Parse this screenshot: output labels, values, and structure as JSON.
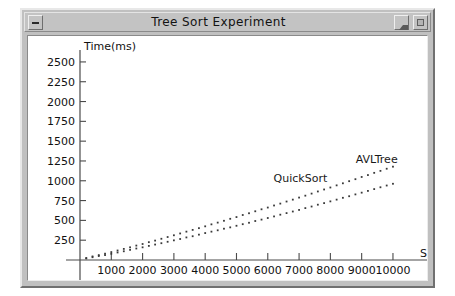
{
  "window": {
    "title": "Tree Sort Experiment",
    "buttons": {
      "menu": "window-menu",
      "minimize": "minimize",
      "maximize": "maximize"
    }
  },
  "chart_data": {
    "type": "scatter",
    "title": "Tree Sort Experiment",
    "xlabel": "Size",
    "ylabel": "Time(ms)",
    "xlim": [
      0,
      10800
    ],
    "ylim": [
      0,
      2600
    ],
    "xticks": [
      1000,
      2000,
      3000,
      4000,
      5000,
      6000,
      7000,
      8000,
      9000,
      10000
    ],
    "yticks": [
      250,
      500,
      750,
      1000,
      1250,
      1500,
      1750,
      2000,
      2250,
      2500
    ],
    "grid": false,
    "legend_position": "inline-annotation",
    "annotations": [
      {
        "text": "QuickSort",
        "x": 7900,
        "y": 980
      },
      {
        "text": "AVLTree",
        "x": 10150,
        "y": 1230
      }
    ],
    "series": [
      {
        "name": "QuickSort",
        "marker": "dot",
        "color": "#3a3a3a",
        "x": [
          200,
          400,
          600,
          800,
          1000,
          1200,
          1400,
          1600,
          1800,
          2000,
          2200,
          2400,
          2600,
          2800,
          3000,
          3200,
          3400,
          3600,
          3800,
          4000,
          4200,
          4400,
          4600,
          4800,
          5000,
          5200,
          5400,
          5600,
          5800,
          6000,
          6200,
          6400,
          6600,
          6800,
          7000,
          7200,
          7400,
          7600,
          7800,
          8000,
          8200,
          8400,
          8600,
          8800,
          9000,
          9200,
          9400,
          9600,
          9800,
          10000
        ],
        "y": [
          20,
          35,
          50,
          62,
          78,
          95,
          110,
          128,
          145,
          160,
          178,
          195,
          212,
          230,
          248,
          265,
          285,
          300,
          320,
          340,
          358,
          375,
          395,
          412,
          432,
          452,
          470,
          492,
          510,
          530,
          550,
          572,
          592,
          612,
          632,
          655,
          675,
          698,
          718,
          740,
          762,
          785,
          805,
          828,
          850,
          872,
          895,
          918,
          940,
          962
        ]
      },
      {
        "name": "AVLTree",
        "marker": "dot",
        "color": "#3a3a3a",
        "x": [
          200,
          400,
          600,
          800,
          1000,
          1200,
          1400,
          1600,
          1800,
          2000,
          2200,
          2400,
          2600,
          2800,
          3000,
          3200,
          3400,
          3600,
          3800,
          4000,
          4200,
          4400,
          4600,
          4800,
          5000,
          5200,
          5400,
          5600,
          5800,
          6000,
          6200,
          6400,
          6600,
          6800,
          7000,
          7200,
          7400,
          7600,
          7800,
          8000,
          8200,
          8400,
          8600,
          8800,
          9000,
          9200,
          9400,
          9600,
          9800,
          10000
        ],
        "y": [
          25,
          45,
          62,
          80,
          100,
          120,
          140,
          160,
          182,
          202,
          225,
          245,
          268,
          290,
          312,
          335,
          358,
          380,
          402,
          425,
          450,
          472,
          495,
          520,
          542,
          568,
          590,
          615,
          640,
          662,
          688,
          712,
          738,
          762,
          788,
          812,
          838,
          865,
          890,
          915,
          942,
          968,
          995,
          1020,
          1048,
          1072,
          1100,
          1125,
          1152,
          1178
        ]
      }
    ]
  }
}
